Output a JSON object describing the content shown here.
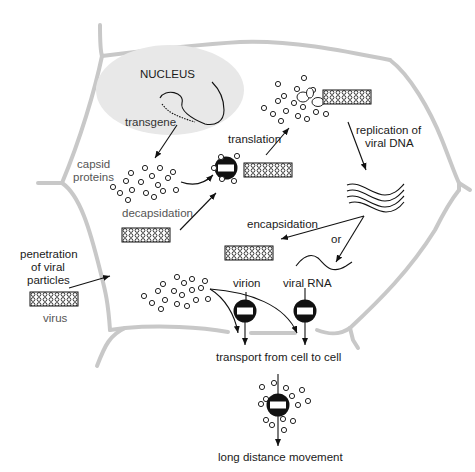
{
  "diagram": {
    "title": "",
    "labels": {
      "nucleus": "NUCLEUS",
      "transgene": "transgene",
      "capsid_proteins_line1": "capsid",
      "capsid_proteins_line2": "proteins",
      "translation": "translation",
      "replication_line1": "replication of",
      "replication_line2": "viral DNA",
      "decapsidation": "decapsidation",
      "penetration_line1": "penetration",
      "penetration_line2": "of viral",
      "penetration_line3": "particles",
      "virus": "virus",
      "encapsidation": "encapsidation",
      "or": "or",
      "virion": "virion",
      "viral_rna": "viral RNA",
      "transport": "transport from cell to cell",
      "long_distance": "long distance movement"
    },
    "colors": {
      "nucleus_fill": "#e6e6e6",
      "cell_wall": "#c8c8c8",
      "ink": "#111111",
      "text": "#333333"
    }
  }
}
